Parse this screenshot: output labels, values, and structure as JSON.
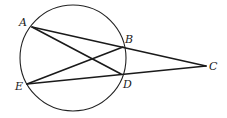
{
  "diagram": {
    "type": "geometry",
    "circle": {
      "cx": 73,
      "cy": 58,
      "r": 53
    },
    "points": {
      "A": {
        "label": "A",
        "x": 32,
        "y": 27,
        "lx": 19,
        "ly": 26
      },
      "B": {
        "label": "B",
        "x": 123,
        "y": 47,
        "lx": 125,
        "ly": 43
      },
      "C": {
        "label": "C",
        "x": 206,
        "y": 66,
        "lx": 209,
        "ly": 70
      },
      "D": {
        "label": "D",
        "x": 121,
        "y": 74,
        "lx": 123,
        "ly": 88
      },
      "E": {
        "label": "E",
        "x": 27,
        "y": 84,
        "lx": 15,
        "ly": 90
      }
    },
    "segments": [
      {
        "name": "segment-ac",
        "from": "A",
        "to": "C"
      },
      {
        "name": "segment-ad",
        "from": "A",
        "to": "D"
      },
      {
        "name": "segment-eb",
        "from": "E",
        "to": "B"
      },
      {
        "name": "segment-ec",
        "from": "E",
        "to": "C"
      }
    ]
  }
}
